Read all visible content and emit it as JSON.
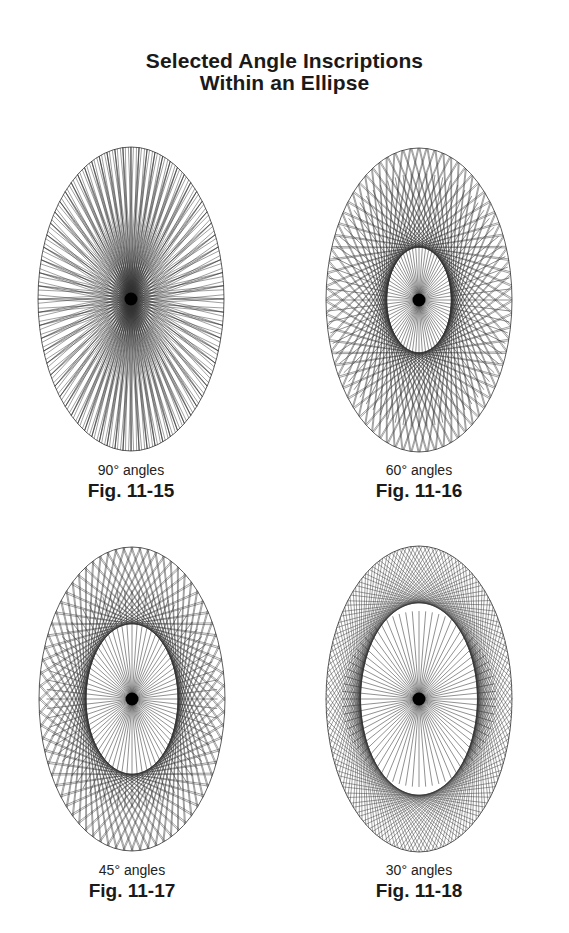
{
  "header": {
    "title_line1": "Selected Angle Inscriptions",
    "title_line2": "Within an Ellipse"
  },
  "figures": [
    {
      "angle_deg": 90,
      "caption": "90° angles",
      "label": "Fig. 11-15",
      "cx": 131,
      "cy": 299,
      "rx": 93,
      "ry": 152
    },
    {
      "angle_deg": 60,
      "caption": "60° angles",
      "label": "Fig. 11-16",
      "cx": 419,
      "cy": 300,
      "rx": 93,
      "ry": 152
    },
    {
      "angle_deg": 45,
      "caption": "45° angles",
      "label": "Fig. 11-17",
      "cx": 132,
      "cy": 699,
      "rx": 93,
      "ry": 152
    },
    {
      "angle_deg": 30,
      "caption": "30° angles",
      "label": "Fig. 11-18",
      "cx": 419,
      "cy": 699,
      "rx": 93,
      "ry": 153
    }
  ],
  "style": {
    "line_color": "#333333",
    "center_dot_color": "#000000",
    "spoke_count": 72
  }
}
